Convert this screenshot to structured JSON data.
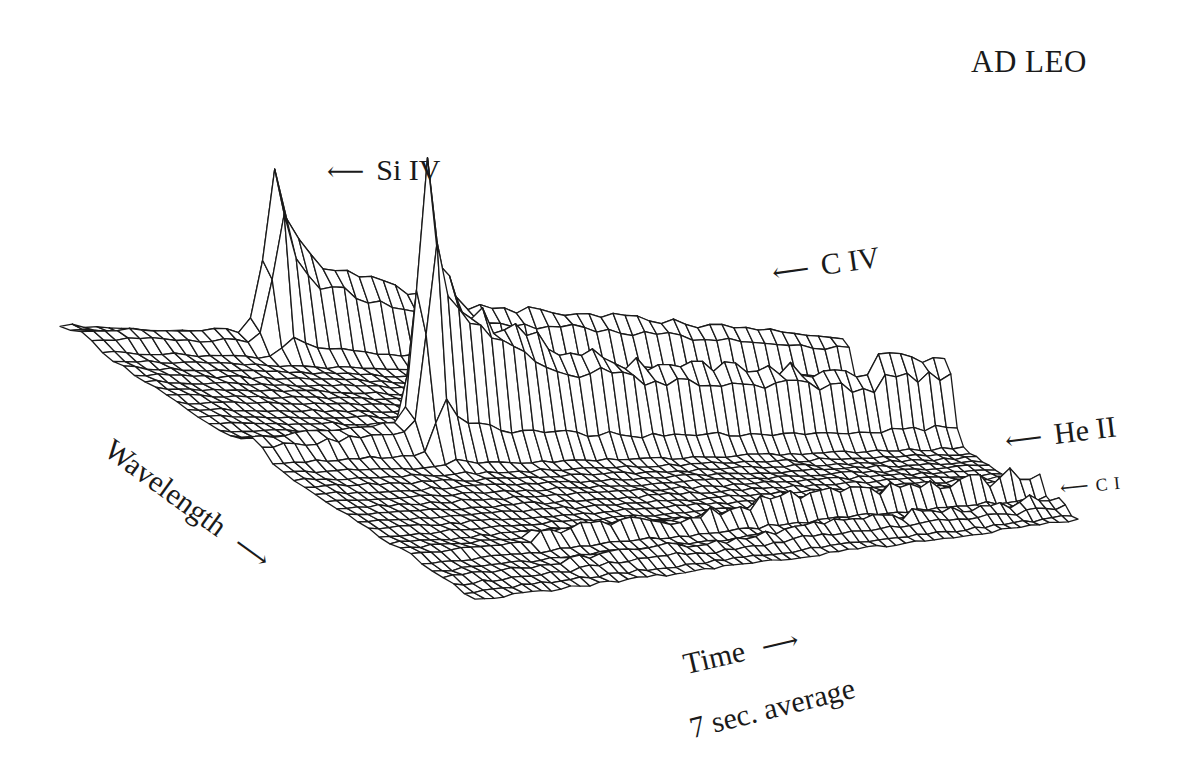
{
  "figure": {
    "title": "AD LEO",
    "line_labels": [
      {
        "id": "si-iv",
        "label": "Si IV",
        "arrow": "⟵"
      },
      {
        "id": "c-iv",
        "label": "C IV",
        "arrow": "⟵"
      },
      {
        "id": "he-ii",
        "label": "He II",
        "arrow": "⟵"
      },
      {
        "id": "c-i",
        "label": "C I",
        "arrow": "⟵"
      }
    ],
    "axes": {
      "wavelength_label": "Wavelength",
      "wavelength_arrow": "⟶",
      "time_label": "Time",
      "time_arrow": "⟶",
      "time_note": "7 sec. average"
    }
  },
  "chart_data": {
    "type": "surface-wireframe",
    "title": "AD LEO",
    "xlabel": "Time",
    "ylabel": "Wavelength",
    "zlabel": "Flux",
    "note": "7 sec. average",
    "grid": {
      "time_steps": 64,
      "wavelength_steps": 40
    },
    "flare_time_profile": {
      "description": "relative flux vs time (0..1 normalized), sharp impulsive flare then slow decay",
      "t": [
        0.0,
        0.22,
        0.24,
        0.255,
        0.27,
        0.3,
        0.35,
        0.45,
        0.55,
        0.6,
        0.7,
        0.85,
        1.0
      ],
      "si_iv": [
        0.05,
        0.1,
        0.6,
        1.0,
        0.7,
        0.55,
        0.45,
        0.35,
        0.3,
        0.3,
        0.28,
        0.25,
        0.22
      ]
    },
    "emission_lines": [
      {
        "name": "Si IV",
        "wavelength_pos": 0.06,
        "peak_height_px": 185,
        "peak_time": 0.255,
        "decay_level": 0.22
      },
      {
        "name": "C IV",
        "wavelength_pos": 0.47,
        "peak_height_px": 290,
        "peak_time": 0.255,
        "decay_level": 0.22
      },
      {
        "name": "He II",
        "wavelength_pos": 0.84,
        "peak_height_px": 45,
        "peak_time": 0.3,
        "decay_level": 0.5
      },
      {
        "name": "C I",
        "wavelength_pos": 0.93,
        "peak_height_px": 22,
        "peak_time": 0.3,
        "decay_level": 0.6
      }
    ],
    "projection_corners": {
      "t0_l0": [
        60,
        325
      ],
      "t1_l0": [
        830,
        368
      ],
      "t0_l1": [
        475,
        600
      ],
      "t1_l1": [
        1078,
        520
      ]
    },
    "colors": {
      "line": "#1a1a1a",
      "background": "#ffffff"
    }
  }
}
